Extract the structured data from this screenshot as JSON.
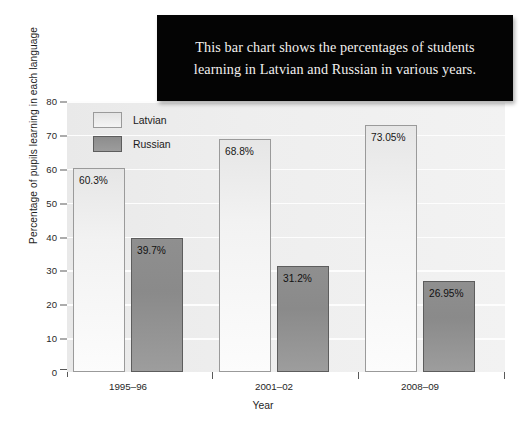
{
  "caption": {
    "text": "This bar chart shows the percentages of students learning in Latvian and Russian in various years."
  },
  "chart_data": {
    "type": "bar",
    "title": "",
    "xlabel": "Year",
    "ylabel": "Percentage of pupils learning in each language",
    "categories": [
      "1995–96",
      "2001–02",
      "2008–09"
    ],
    "series": [
      {
        "name": "Latvian",
        "color": "#f2f2f2",
        "values": [
          60.3,
          68.8,
          73.05
        ],
        "labels": [
          "60.3%",
          "68.8%",
          "73.05%"
        ]
      },
      {
        "name": "Russian",
        "color": "#8a8a8a",
        "values": [
          39.7,
          31.2,
          26.95
        ],
        "labels": [
          "39.7%",
          "31.2%",
          "26.95%"
        ]
      }
    ],
    "ylim": [
      0,
      80
    ],
    "yticks": [
      0,
      10,
      20,
      30,
      40,
      50,
      60,
      70,
      80
    ],
    "ytick_labels": [
      "0",
      "10",
      "20",
      "30",
      "40",
      "50",
      "60",
      "70",
      "80"
    ],
    "grid": true,
    "legend_position": "top-left",
    "plot_background": "#eeeeee",
    "gridline_color": "#fdfdfd"
  }
}
